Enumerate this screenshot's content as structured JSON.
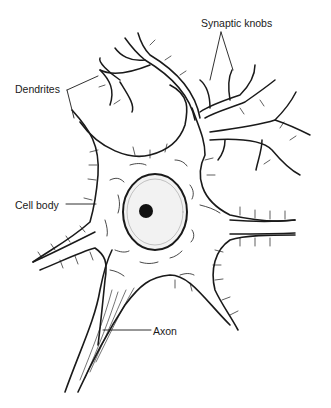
{
  "diagram": {
    "labels": {
      "synaptic_knobs": "Synaptic knobs",
      "dendrites": "Dendrites",
      "cell_body": "Cell body",
      "axon": "Axon"
    },
    "colors": {
      "ink": "#1a1a1a",
      "background": "#ffffff"
    }
  }
}
